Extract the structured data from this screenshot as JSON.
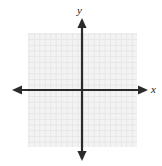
{
  "figure": {
    "kind": "coordinate-plane",
    "background_color": "#ffffff"
  },
  "grid": {
    "line_color": "#e6e6e6",
    "fill_color": "#f3f3f3",
    "cell_size_px": 5.45,
    "columns": 20,
    "rows": 20,
    "gridlines_visible": "true"
  },
  "axes": {
    "color": "#2b2b2b",
    "line_width_px": 2,
    "origin": {
      "x": 82,
      "y": 90
    },
    "x_axis": {
      "label": "x",
      "label_style": "italic",
      "arrow_left": "true",
      "arrow_right": "true",
      "tick_labels": [],
      "range_px": [
        12,
        148
      ]
    },
    "y_axis": {
      "label": "y",
      "label_style": "italic",
      "arrow_up": "true",
      "arrow_down": "true",
      "tick_labels": [],
      "range_px": [
        18,
        161
      ]
    }
  },
  "chart_data": {
    "type": "scatter",
    "title": "",
    "subtitle": "",
    "xlabel": "x",
    "ylabel": "y",
    "xlim": [
      -10,
      10
    ],
    "ylim": [
      -10,
      10
    ],
    "xticks": [],
    "yticks": [],
    "grid": "true",
    "legend": "none",
    "series": [],
    "annotations": []
  }
}
